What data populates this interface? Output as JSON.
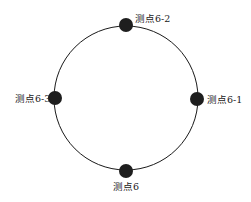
{
  "diagram": {
    "type": "measurement-points-on-circle",
    "circle": {
      "cx": 126,
      "cy": 98,
      "r": 72,
      "stroke": "#1a1a1a"
    },
    "point_color": "#1e1e1e",
    "points": [
      {
        "id": "6-2",
        "label": "测点6-2",
        "position": "top",
        "cx": 126,
        "cy": 25
      },
      {
        "id": "6-3",
        "label": "测点6-3",
        "position": "left",
        "cx": 55,
        "cy": 98
      },
      {
        "id": "6-1",
        "label": "测点6-1",
        "position": "right",
        "cx": 197,
        "cy": 99
      },
      {
        "id": "6",
        "label": "测点6",
        "position": "bottom",
        "cx": 126,
        "cy": 171
      }
    ]
  }
}
